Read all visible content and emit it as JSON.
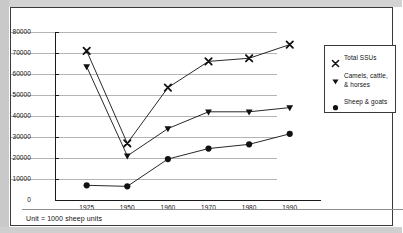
{
  "chart_data": {
    "type": "line",
    "title": "",
    "xlabel": "",
    "ylabel": "",
    "categories": [
      "1925",
      "1950",
      "1960",
      "1970",
      "1980",
      "1990"
    ],
    "ylim": [
      0,
      80000
    ],
    "ytick_step": 10000,
    "yticks": [
      "0",
      "10000",
      "20000",
      "30000",
      "40000",
      "50000",
      "60000",
      "70000",
      "80000"
    ],
    "grid": true,
    "legend_position": "right",
    "series": [
      {
        "name": "Total SSUs",
        "marker": "x-cross",
        "color": "#111111",
        "values": [
          71000,
          27000,
          53500,
          66000,
          67500,
          74000
        ]
      },
      {
        "name": "Camels, cattle, & horses",
        "marker": "triangle-down",
        "color": "#111111",
        "values": [
          63500,
          21000,
          34000,
          42000,
          42000,
          44000
        ]
      },
      {
        "name": "Sheep & goats",
        "marker": "circle",
        "color": "#111111",
        "values": [
          7000,
          6500,
          19500,
          24500,
          26500,
          31500
        ]
      }
    ],
    "annotations": [
      "Unit = 1000 sheep units"
    ]
  },
  "legend": {
    "entries": [
      {
        "label": "Total SSUs"
      },
      {
        "label": "Camels, cattle,\n& horses"
      },
      {
        "label": "Sheep & goats"
      }
    ]
  },
  "footer": {
    "unit_note": "Unit = 1000 sheep units"
  },
  "colors": {
    "ink": "#111111",
    "grid": "#b4b4b4",
    "frame": "#3a3a3a"
  }
}
